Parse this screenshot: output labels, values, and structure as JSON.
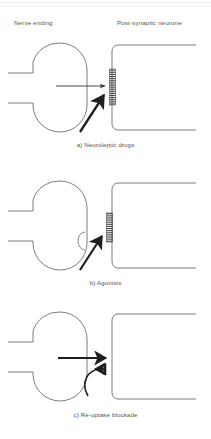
{
  "figure": {
    "headers": {
      "left": "Nerve ending",
      "right": "Post-synaptic neurone"
    },
    "colors": {
      "ink": "#55555a",
      "stroke": "#6e6e73",
      "arrow": "#2b2b2b",
      "receptor": "#444449",
      "background": "#ffffff"
    },
    "panels": [
      {
        "id": "a",
        "caption": "a) Neuroleptic drugs",
        "nerve_ending": "bouton",
        "post_synaptic": "dendrite",
        "receptor": "present",
        "arrows": [
          "transmitter-release-horizontal",
          "drug-blockade-diagonal"
        ]
      },
      {
        "id": "b",
        "caption": "b) Agonists",
        "nerve_ending": "bouton",
        "post_synaptic": "dendrite",
        "receptor": "present",
        "arrows": [
          "agonist-diagonal"
        ]
      },
      {
        "id": "c",
        "caption": "c) Re-uptake blockade",
        "nerve_ending": "bouton",
        "post_synaptic": "dendrite",
        "receptor": "absent",
        "arrows": [
          "transmitter-release-horizontal",
          "reuptake-curved",
          "blockade-bar"
        ]
      }
    ]
  }
}
